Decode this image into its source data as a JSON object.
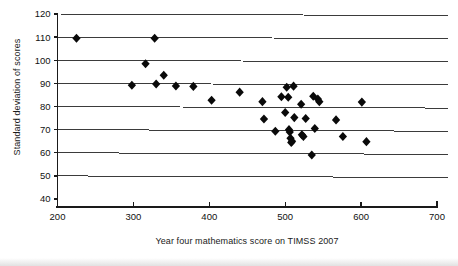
{
  "chart_data": {
    "type": "scatter",
    "title": "",
    "xlabel": "Year four mathematics score on TIMSS 2007",
    "ylabel": "Standard deviation of scores",
    "xlim": [
      200,
      700
    ],
    "ylim": [
      40,
      120
    ],
    "xticks": [
      200,
      300,
      400,
      500,
      600,
      700
    ],
    "yticks": [
      40,
      50,
      60,
      70,
      80,
      90,
      100,
      110,
      120
    ],
    "xtick_labels": [
      "200",
      "300",
      "400",
      "500",
      "600",
      "700"
    ],
    "ytick_labels": [
      "40",
      "50",
      "60",
      "70",
      "80",
      "90",
      "100",
      "110",
      "120"
    ],
    "grid": "horizontal",
    "legend": "none",
    "marker": "diamond",
    "marker_color": "#0a0a0a",
    "marker_size": 6,
    "points": [
      [
        225,
        109.5
      ],
      [
        298,
        89.2
      ],
      [
        316,
        98.5
      ],
      [
        328,
        109.5
      ],
      [
        330,
        89.7
      ],
      [
        340,
        93.5
      ],
      [
        356,
        88.9
      ],
      [
        379,
        88.7
      ],
      [
        403,
        82.7
      ],
      [
        440,
        86.2
      ],
      [
        470,
        82.1
      ],
      [
        472,
        74.6
      ],
      [
        487,
        69.3
      ],
      [
        495,
        84.2
      ],
      [
        500,
        77.4
      ],
      [
        502,
        88.3
      ],
      [
        504,
        84.0
      ],
      [
        505,
        70.0
      ],
      [
        506,
        69.0
      ],
      [
        507,
        66.3
      ],
      [
        508,
        64.4
      ],
      [
        509,
        65.0
      ],
      [
        511,
        88.8
      ],
      [
        512,
        75.2
      ],
      [
        521,
        81.0
      ],
      [
        522,
        67.8
      ],
      [
        524,
        67.0
      ],
      [
        527,
        74.8
      ],
      [
        535,
        59.0
      ],
      [
        537,
        84.4
      ],
      [
        539,
        70.5
      ],
      [
        543,
        83.2
      ],
      [
        545,
        82.1
      ],
      [
        567,
        74.2
      ],
      [
        576,
        67.0
      ],
      [
        601,
        81.9
      ],
      [
        607,
        64.8
      ]
    ]
  },
  "figure": {
    "background_color": "#ffffff",
    "axis_color": "#1a1a1a",
    "gridline_color": "#3b3b3b"
  }
}
